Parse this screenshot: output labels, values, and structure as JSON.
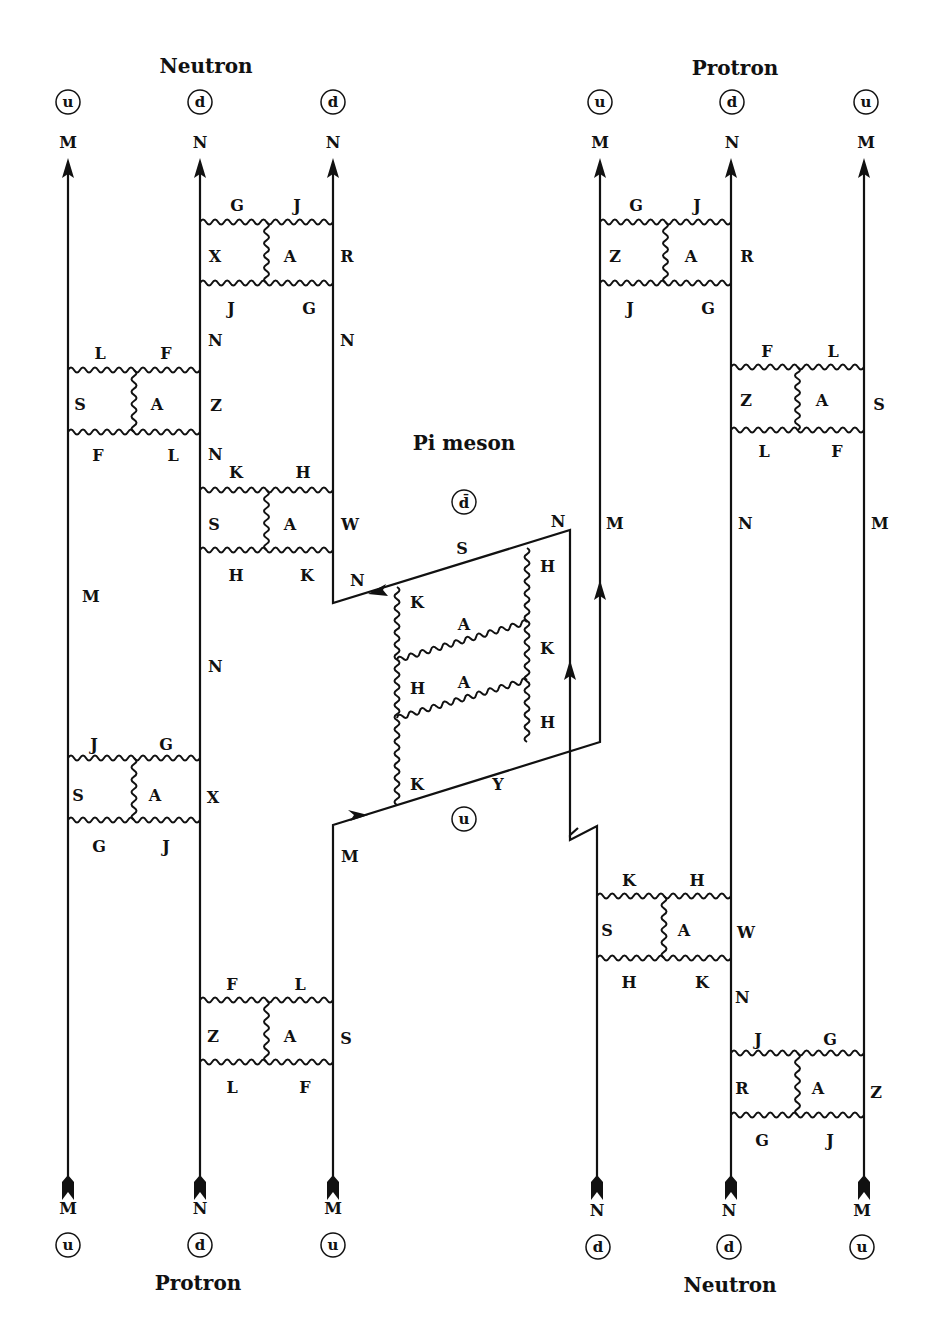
{
  "diagram": {
    "type": "quark-gluon exchange diagram (neutron-proton via pi meson)",
    "top_left_title": "Neutron",
    "top_right_title": "Protron",
    "bottom_left_title": "Protron",
    "bottom_right_title": "Neutron",
    "center_title": "Pi meson",
    "top_left_quarks": [
      "u",
      "d",
      "d"
    ],
    "top_left_ends": [
      "M",
      "N",
      "N"
    ],
    "top_right_quarks": [
      "u",
      "d",
      "u"
    ],
    "top_right_ends": [
      "M",
      "N",
      "M"
    ],
    "bottom_left_quarks": [
      "u",
      "d",
      "u"
    ],
    "bottom_left_ends": [
      "M",
      "N",
      "M"
    ],
    "bottom_right_quarks": [
      "d",
      "d",
      "u"
    ],
    "bottom_right_ends": [
      "N",
      "N",
      "M"
    ],
    "meson_quarks": {
      "antiquark": "d̄",
      "quark": "u"
    },
    "boxes": [
      {
        "id": "L-top",
        "top": [
          "G",
          "J"
        ],
        "left": "X",
        "mid": "A",
        "right": "R",
        "bottom": [
          "J",
          "G"
        ]
      },
      {
        "id": "L-upper",
        "top": [
          "L",
          "F"
        ],
        "left": "S",
        "mid": "A",
        "right": "Z",
        "bottom": [
          "F",
          "L"
        ]
      },
      {
        "id": "L-mid",
        "top": [
          "K",
          "H"
        ],
        "left": "S",
        "mid": "A",
        "right": "W",
        "bottom": [
          "H",
          "K"
        ]
      },
      {
        "id": "L-lower",
        "top": [
          "J",
          "G"
        ],
        "left": "S",
        "mid": "A",
        "right": "X",
        "bottom": [
          "G",
          "J"
        ]
      },
      {
        "id": "L-bottom",
        "top": [
          "F",
          "L"
        ],
        "left": "Z",
        "mid": "A",
        "right": "S",
        "bottom": [
          "L",
          "F"
        ]
      },
      {
        "id": "R-top",
        "top": [
          "G",
          "J"
        ],
        "left": "Z",
        "mid": "A",
        "right": "R",
        "bottom": [
          "J",
          "G"
        ]
      },
      {
        "id": "R-upper",
        "top": [
          "F",
          "L"
        ],
        "left": "Z",
        "mid": "A",
        "right": "S",
        "bottom": [
          "L",
          "F"
        ]
      },
      {
        "id": "R-mid",
        "top": [
          "K",
          "H"
        ],
        "left": "S",
        "mid": "A",
        "right": "W",
        "bottom": [
          "H",
          "K"
        ]
      },
      {
        "id": "R-bottom",
        "top": [
          "J",
          "G"
        ],
        "left": "R",
        "mid": "A",
        "right": "Z",
        "bottom": [
          "G",
          "J"
        ]
      }
    ],
    "line_labels": {
      "left_col1_mid": "M",
      "left_col2_a": "N",
      "left_col2_b": "N",
      "left_col2_c": "N",
      "left_col3_a": "N",
      "left_col3_b": "N",
      "left_col3_c": "M",
      "right_col1_mid": "M",
      "right_col2_mid": "N",
      "right_col2_low": "N",
      "right_col3_mid": "M"
    },
    "meson": {
      "top_line": "S",
      "top_right_end": "N",
      "bottom_line": "Y",
      "left_glue": [
        "K",
        "H",
        "K"
      ],
      "right_glue": [
        "H",
        "K",
        "H"
      ],
      "cross_glue": [
        "A",
        "A"
      ]
    }
  }
}
